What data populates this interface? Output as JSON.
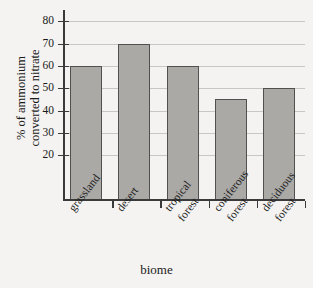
{
  "chart_data": {
    "type": "bar",
    "title": "",
    "categories": [
      "grassland",
      "desert",
      "tropical forest",
      "coniferous forest",
      "deciduous forest"
    ],
    "category_lines": [
      [
        "grassland"
      ],
      [
        "desert"
      ],
      [
        "tropical",
        "forest"
      ],
      [
        "coniferous",
        "forest"
      ],
      [
        "deciduous",
        "forest"
      ]
    ],
    "values": [
      60,
      70,
      60,
      45,
      50
    ],
    "xlabel": "biome",
    "ylabel": "% of ammonium converted to nitrate",
    "ylabel_lines": [
      "% of ammonium",
      "converted to nitrate"
    ],
    "ylim": [
      0,
      85
    ],
    "yticks": [
      20,
      30,
      40,
      50,
      60,
      70,
      80
    ],
    "ytick_labels": [
      "20",
      "30",
      "40",
      "50",
      "60",
      "70",
      "80"
    ],
    "grid": true,
    "legend": "none",
    "bar_color": "#aaa9a6",
    "bar_edge_color": "#50504e",
    "background_color": "#f4f3f1",
    "gridline_color": "#c9c7c4",
    "axis_color": "#3a3a3a"
  }
}
